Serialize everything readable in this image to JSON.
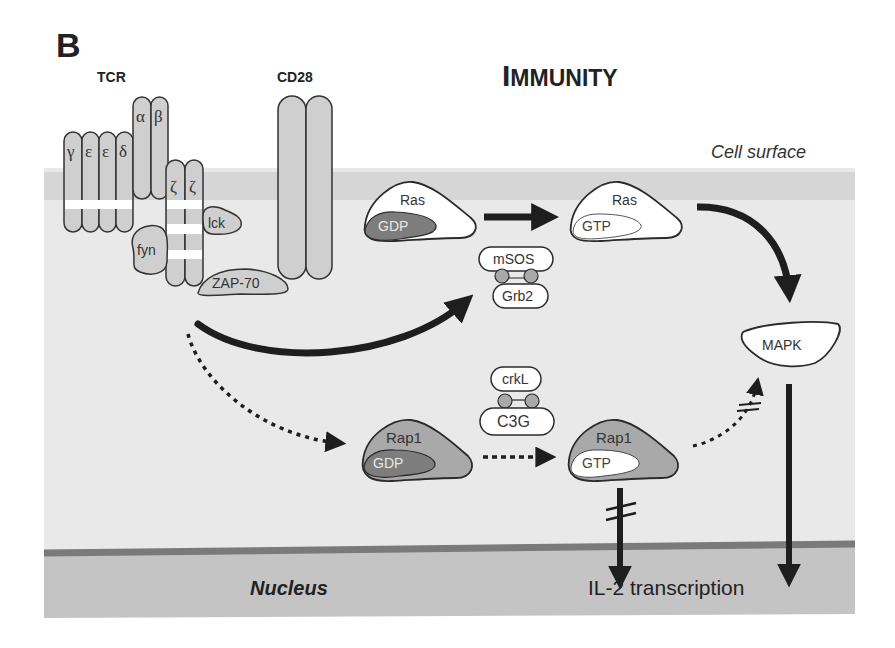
{
  "panel_label": "B",
  "title": "Immunity",
  "title_display": {
    "first": "I",
    "rest": "MMUNITY"
  },
  "labels": {
    "tcr": "TCR",
    "cd28": "CD28",
    "cell_surface": "Cell surface",
    "nucleus": "Nucleus",
    "il2": "IL-2 transcription"
  },
  "tcr_chains": {
    "gamma": "γ",
    "epsilon1": "ε",
    "epsilon2": "ε",
    "delta": "δ",
    "alpha": "α",
    "beta": "β",
    "zeta1": "ζ",
    "zeta2": "ζ"
  },
  "kinases": {
    "fyn": "fyn",
    "lck": "lck",
    "zap70": "ZAP-70"
  },
  "proteins": {
    "ras_gdp": {
      "name": "Ras",
      "nucleotide": "GDP"
    },
    "ras_gtp": {
      "name": "Ras",
      "nucleotide": "GTP"
    },
    "rap1_gdp": {
      "name": "Rap1",
      "nucleotide": "GDP"
    },
    "rap1_gtp": {
      "name": "Rap1",
      "nucleotide": "GTP"
    },
    "msos": "mSOS",
    "grb2": "Grb2",
    "crkl": "crkL",
    "c3g": "C3G",
    "mapk": "MAPK"
  },
  "colors": {
    "membrane": "#d6d6d6",
    "cytoplasm": "#e9e9e9",
    "nucleus": "#c4c4c4",
    "nuclear_envelope": "#7a7a7a",
    "receptor_fill": "#cfcfcf",
    "dark_fill": "#7d7d7d",
    "rap_fill": "#a9a9a9",
    "stroke": "#2b2b2b",
    "text": "#222222"
  },
  "edges": [
    {
      "from": "TCR",
      "to": "mSOS/Grb2",
      "style": "solid"
    },
    {
      "from": "TCR",
      "to": "Rap1-GDP",
      "style": "dotted"
    },
    {
      "from": "Ras-GDP",
      "to": "Ras-GTP",
      "style": "solid"
    },
    {
      "from": "Ras-GTP",
      "to": "MAPK",
      "style": "solid"
    },
    {
      "from": "Rap1-GDP",
      "to": "Rap1-GTP",
      "style": "dotted"
    },
    {
      "from": "Rap1-GTP",
      "to": "MAPK",
      "style": "dotted",
      "inhibited": true
    },
    {
      "from": "Rap1-GTP",
      "to": "IL-2 transcription",
      "style": "solid",
      "inhibited": true
    },
    {
      "from": "MAPK",
      "to": "IL-2 transcription",
      "style": "solid"
    }
  ]
}
